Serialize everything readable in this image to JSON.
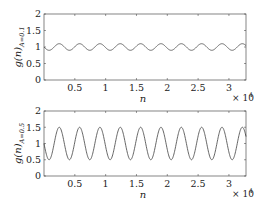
{
  "chart_data": [
    {
      "type": "line",
      "title": "",
      "xlabel": "n",
      "ylabel": "g(n)_{A=0.1}",
      "ylabel_main": "g(n)",
      "ylabel_sub": "A=0.1",
      "xlim": [
        0,
        32768
      ],
      "ylim": [
        0,
        2
      ],
      "x_ticks": [
        5000,
        10000,
        15000,
        20000,
        25000,
        30000
      ],
      "x_tick_labels": [
        "0.5",
        "1",
        "1.5",
        "2",
        "2.5",
        "3"
      ],
      "x_multiplier": "× 10^4",
      "x_multiplier_base": "× 10",
      "x_multiplier_exp": "4",
      "y_ticks": [
        0,
        0.5,
        1,
        1.5,
        2
      ],
      "y_tick_labels": [
        "0",
        "0.5",
        "1",
        "1.5",
        "2"
      ],
      "grid": false,
      "series": [
        {
          "name": "g(n), A=0.1",
          "formula": "1 - A*sin(2*pi*n/P)",
          "amplitude": 0.1,
          "offset": 1,
          "period": 3300,
          "color": "#555555"
        }
      ]
    },
    {
      "type": "line",
      "title": "",
      "xlabel": "n",
      "ylabel": "g(n)_{A=0.5}",
      "ylabel_main": "g(n)",
      "ylabel_sub": "A=0.5",
      "xlim": [
        0,
        32768
      ],
      "ylim": [
        0,
        2
      ],
      "x_ticks": [
        5000,
        10000,
        15000,
        20000,
        25000,
        30000
      ],
      "x_tick_labels": [
        "0.5",
        "1",
        "1.5",
        "2",
        "2.5",
        "3"
      ],
      "x_multiplier": "× 10^4",
      "x_multiplier_base": "× 10",
      "x_multiplier_exp": "4",
      "y_ticks": [
        0,
        0.5,
        1,
        1.5,
        2
      ],
      "y_tick_labels": [
        "0",
        "0.5",
        "1",
        "1.5",
        "2"
      ],
      "grid": false,
      "series": [
        {
          "name": "g(n), A=0.5",
          "formula": "1 - A*sin(2*pi*n/P)",
          "amplitude": 0.5,
          "offset": 1,
          "period": 3300,
          "color": "#555555"
        }
      ]
    }
  ],
  "layout": {
    "panels": [
      {
        "left": 44,
        "top": 14,
        "right": 246,
        "bottom": 80
      },
      {
        "left": 44,
        "top": 111,
        "right": 246,
        "bottom": 176
      }
    ]
  }
}
